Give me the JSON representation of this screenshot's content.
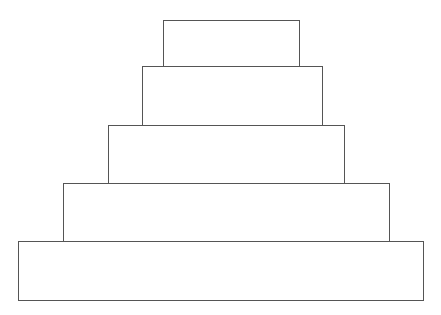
{
  "diagram": {
    "type": "stepped-pyramid",
    "stroke_color": "#555555",
    "fill_color": "#ffffff",
    "background": "#ffffff",
    "tiers": [
      {
        "level": 1,
        "label": "",
        "x": 163,
        "y": 20,
        "width": 137,
        "height": 47
      },
      {
        "level": 2,
        "label": "",
        "x": 142,
        "y": 66,
        "width": 181,
        "height": 60
      },
      {
        "level": 3,
        "label": "",
        "x": 108,
        "y": 125,
        "width": 237,
        "height": 59
      },
      {
        "level": 4,
        "label": "",
        "x": 63,
        "y": 183,
        "width": 327,
        "height": 59
      },
      {
        "level": 5,
        "label": "",
        "x": 18,
        "y": 241,
        "width": 406,
        "height": 60
      }
    ]
  }
}
